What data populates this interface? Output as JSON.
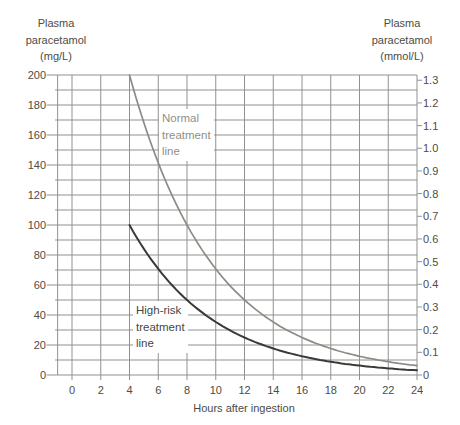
{
  "chart": {
    "y_left_title": "Plasma\nparacetamol\n(mg/L)",
    "y_right_title": "Plasma\nparacetamol\n(mmol/L)",
    "normal_line_label": "Normal\ntreatment\nline",
    "high_risk_line_label": "High-risk\ntreatment\nline"
  },
  "chart_data": {
    "type": "line",
    "grid_color": "#919191",
    "x": {
      "label": "Hours after ingestion",
      "min": -1,
      "max": 24,
      "ticks": [
        0,
        2,
        4,
        6,
        8,
        10,
        12,
        14,
        16,
        18,
        20,
        22,
        24
      ],
      "gridlines_every": 2
    },
    "y_left": {
      "label": "Plasma paracetamol (mg/L)",
      "min": 0,
      "max": 200,
      "tick_labels": [
        0,
        20,
        40,
        60,
        80,
        100,
        120,
        140,
        160,
        180,
        200
      ],
      "gridlines_every": 10
    },
    "y_right": {
      "label": "Plasma paracetamol (mmol/L)",
      "tick_labels": [
        "1.3",
        "1.2",
        "1.1",
        "1.0",
        "0.9",
        "0.8",
        "0.7",
        "0.6",
        "0.5",
        "0.4",
        "0.3",
        "0.2",
        "0.1",
        "0"
      ],
      "mg_per_mmol": 151.16
    },
    "series": [
      {
        "name": "Normal treatment line",
        "color": "#8c8c84",
        "width": 1.7,
        "points": [
          [
            4,
            200
          ],
          [
            5,
            168.18
          ],
          [
            6,
            141.42
          ],
          [
            7,
            118.92
          ],
          [
            8,
            100
          ],
          [
            9,
            84.09
          ],
          [
            10,
            70.71
          ],
          [
            11,
            59.46
          ],
          [
            12,
            50
          ],
          [
            13,
            42.04
          ],
          [
            14,
            35.36
          ],
          [
            15,
            29.73
          ],
          [
            16,
            25
          ],
          [
            17,
            21.02
          ],
          [
            18,
            17.68
          ],
          [
            19,
            14.87
          ],
          [
            20,
            12.5
          ],
          [
            21,
            10.51
          ],
          [
            22,
            8.84
          ],
          [
            23,
            7.43
          ],
          [
            24,
            6.25
          ]
        ]
      },
      {
        "name": "High-risk treatment line",
        "color": "#3a3a36",
        "width": 2,
        "points": [
          [
            4,
            100
          ],
          [
            5,
            84.09
          ],
          [
            6,
            70.71
          ],
          [
            7,
            59.46
          ],
          [
            8,
            50
          ],
          [
            9,
            42.04
          ],
          [
            10,
            35.36
          ],
          [
            11,
            29.73
          ],
          [
            12,
            25
          ],
          [
            13,
            21.02
          ],
          [
            14,
            17.68
          ],
          [
            15,
            14.87
          ],
          [
            16,
            12.5
          ],
          [
            17,
            10.51
          ],
          [
            18,
            8.84
          ],
          [
            19,
            7.43
          ],
          [
            20,
            6.25
          ],
          [
            21,
            5.25
          ],
          [
            22,
            4.42
          ],
          [
            23,
            3.72
          ],
          [
            24,
            3.13
          ]
        ]
      }
    ]
  }
}
